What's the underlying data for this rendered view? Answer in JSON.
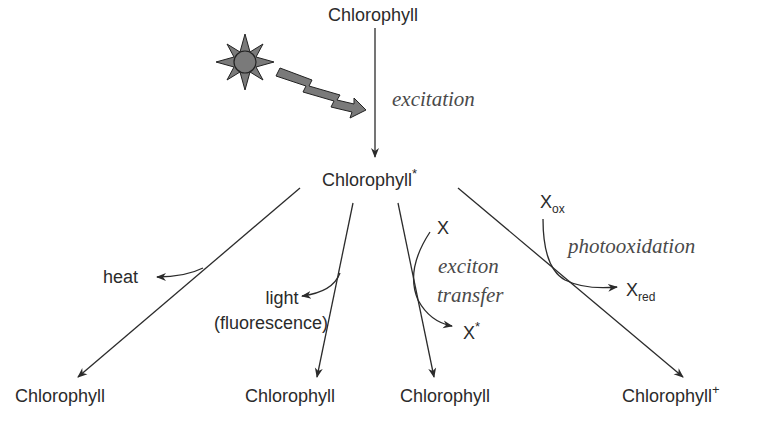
{
  "diagram": {
    "type": "reaction-pathway",
    "top_node": "Chlorophyll",
    "excited_node": "Chlorophyll",
    "excited_sup": "*",
    "excitation_label": "excitation",
    "light_source_icon": "sun-icon",
    "photon_icon": "lightning-arrow-icon",
    "pathways": [
      {
        "name": "heat",
        "side_label": "heat",
        "product": "Chlorophyll"
      },
      {
        "name": "fluorescence",
        "side_label_line1": "light",
        "side_label_line2": "(fluorescence)",
        "product": "Chlorophyll"
      },
      {
        "name": "exciton-transfer",
        "reactant": "X",
        "side_product": "X",
        "side_product_sup": "*",
        "process_line1": "exciton",
        "process_line2": "transfer",
        "product": "Chlorophyll"
      },
      {
        "name": "photooxidation",
        "reactant": "X",
        "reactant_sub": "ox",
        "side_product": "X",
        "side_product_sub": "red",
        "process": "photooxidation",
        "product": "Chlorophyll",
        "product_sup": "+"
      }
    ],
    "line_color": "#2b2b2b",
    "sun_fill": "#7a7a7a"
  }
}
